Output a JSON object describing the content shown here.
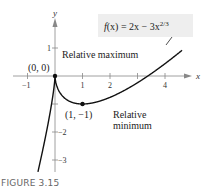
{
  "chart_data": {
    "type": "line",
    "title": "",
    "function_label": "f(x) = 2x − 3x^(2/3)",
    "equation": {
      "lhs": "f(x) = 2x − 3x",
      "exponent": "2/3"
    },
    "xlabel": "x",
    "ylabel": "y",
    "xlim": [
      -1.2,
      4.7
    ],
    "ylim": [
      -3.5,
      2.2
    ],
    "x_ticks": [
      -1,
      1,
      2,
      4
    ],
    "y_ticks": [
      1,
      -2,
      -3
    ],
    "x_tick_labels": [
      "−1",
      "1",
      "2",
      "4"
    ],
    "y_tick_labels": [
      "1",
      "−2",
      "−3"
    ],
    "grid": false,
    "series": [
      {
        "name": "f(x) = 2x − 3x^(2/3)",
        "x": [
          -0.6,
          -0.4,
          -0.2,
          -0.1,
          0,
          0.05,
          0.1,
          0.2,
          0.4,
          0.6,
          0.8,
          1,
          1.5,
          2,
          2.5,
          3,
          3.375,
          4,
          4.6
        ],
        "y": [
          -3.29,
          -2.43,
          -1.43,
          -0.85,
          0,
          -0.31,
          -0.45,
          -0.63,
          -0.83,
          -0.93,
          -0.99,
          -1,
          -0.93,
          -0.76,
          -0.52,
          -0.24,
          0,
          0.44,
          0.89
        ]
      }
    ],
    "points": [
      {
        "label": "(0, 0)",
        "x": 0,
        "y": 0,
        "note": "Relative maximum"
      },
      {
        "label": "(1, −1)",
        "x": 1,
        "y": -1,
        "note": "Relative minimum"
      }
    ],
    "annotations": [
      {
        "text": "Relative maximum"
      },
      {
        "text_lines": [
          "Relative",
          "minimum"
        ]
      }
    ]
  },
  "figure": {
    "caption": "FIGURE 3.15",
    "max_point_label": "(0, 0)",
    "min_point_label": "(1, −1)",
    "max_annotation": "Relative maximum",
    "min_annotation_line1": "Relative",
    "min_annotation_line2": "minimum",
    "x_axis_label": "x",
    "y_axis_label": "y",
    "tick_x_neg1": "−1",
    "tick_x_1": "1",
    "tick_x_2": "2",
    "tick_x_4": "4",
    "tick_y_1": "1",
    "tick_y_neg2": "−2",
    "tick_y_neg3": "−3",
    "eq_main": "f(x) = 2x − 3x",
    "eq_exp": "2/3",
    "colors": {
      "curve": "#111111",
      "axis": "#888888",
      "label_box": "#eeeeee"
    }
  }
}
